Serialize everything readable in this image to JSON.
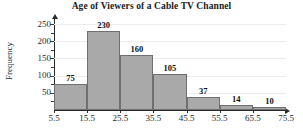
{
  "chart_data": {
    "type": "bar",
    "title": "Age of Viewers of a Cable TV Channel",
    "xlabel": "",
    "ylabel": "Frequency",
    "categories": [
      "5.5-15.5",
      "15.5-25.5",
      "25.5-35.5",
      "35.5-45.5",
      "45.5-55.5",
      "55.5-65.5",
      "65.5-75.5"
    ],
    "values": [
      75,
      230,
      160,
      105,
      37,
      14,
      10
    ],
    "bin_edges": [
      5.5,
      15.5,
      25.5,
      35.5,
      45.5,
      55.5,
      65.5,
      75.5
    ],
    "x_tick_labels": [
      "5.5",
      "15.5",
      "25.5",
      "35.5",
      "45.5",
      "55.5",
      "65.5",
      "75.5"
    ],
    "y_tick_labels": [
      "50",
      "100",
      "150",
      "200",
      "250"
    ],
    "y_ticks": [
      50,
      100,
      150,
      200,
      250
    ],
    "ylim": [
      0,
      262
    ],
    "xlim": [
      5.5,
      75.5
    ],
    "grid": true,
    "legend": "none",
    "data_labels": [
      "75",
      "230",
      "160",
      "105",
      "37",
      "14",
      "10"
    ],
    "bar_fill_color": "#a9a9a9",
    "bar_edge_color": "#6f6f6f",
    "gridline_color": "#ededed",
    "axis_color": "#2a2a2a",
    "background_color": "#ffffff"
  }
}
